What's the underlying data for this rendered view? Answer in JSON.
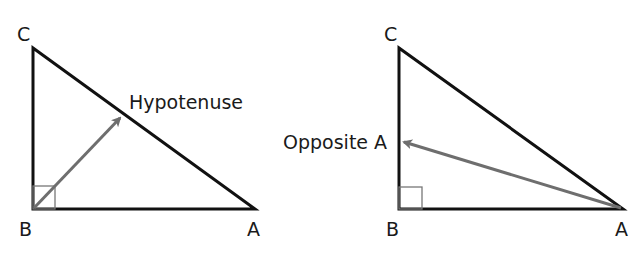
{
  "diagrams": [
    {
      "id": "left",
      "vertices": {
        "C": "C",
        "B": "B",
        "A": "A"
      },
      "annotation": "Hypotenuse"
    },
    {
      "id": "right",
      "vertices": {
        "C": "C",
        "B": "B",
        "A": "A"
      },
      "annotation": "Opposite A"
    }
  ],
  "colors": {
    "lines": "#111111",
    "arrow": "#6e6e6e",
    "right_angle": "#777777"
  }
}
